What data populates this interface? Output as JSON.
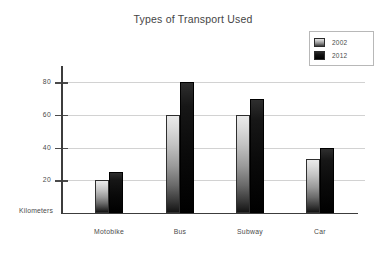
{
  "chart_data": {
    "type": "bar",
    "title": "Types of Transport Used",
    "xlabel": "",
    "ylabel": "Kilometers",
    "categories": [
      "Motobike",
      "Bus",
      "Subway",
      "Car"
    ],
    "series": [
      {
        "name": "2002",
        "values": [
          20,
          60,
          60,
          33
        ],
        "color": "#b0b0b0"
      },
      {
        "name": "2012",
        "values": [
          25,
          80,
          70,
          40
        ],
        "color": "#000000"
      }
    ],
    "ylim": [
      0,
      90
    ],
    "yticks": [
      20,
      40,
      60,
      80
    ],
    "ytick_labels": [
      "20",
      "40",
      "60",
      "80"
    ],
    "grid": true,
    "legend_position": "top-right"
  },
  "legend": {
    "entries": [
      {
        "label": "2002",
        "swatch": "gradient-gray-swatch"
      },
      {
        "label": "2012",
        "swatch": "black-swatch"
      }
    ]
  },
  "axis": {
    "y_title": "Kilometers"
  }
}
